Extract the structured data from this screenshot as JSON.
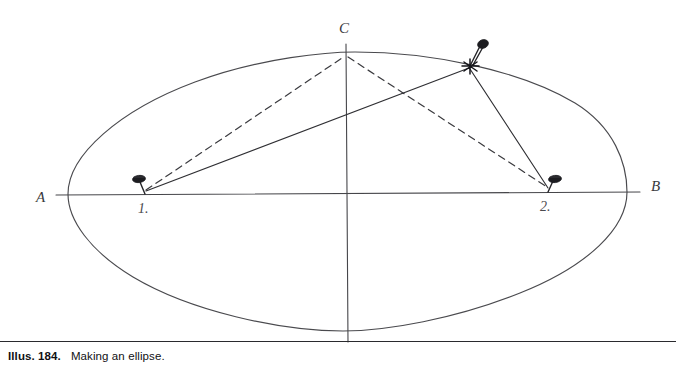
{
  "caption": {
    "number": "Illus. 184.",
    "text": "Making an ellipse."
  },
  "figure": {
    "title": "Making an ellipse",
    "method": "pin-and-string ellipse construction",
    "background_color": "#ffffff",
    "ink_color": "#3b3b3f",
    "labels": {
      "left_vertex": "A",
      "right_vertex": "B",
      "top_vertex": "C",
      "bottom_vertex": "D",
      "focus_left": "1.",
      "focus_right": "2."
    },
    "geometry": {
      "center_x": 347,
      "center_y": 193,
      "semi_major": 280,
      "semi_minor": 139,
      "vertex_a": [
        68,
        194
      ],
      "vertex_b": [
        627,
        192
      ],
      "vertex_c": [
        346,
        54
      ],
      "vertex_d": [
        347,
        331
      ],
      "focus_1": [
        145,
        194
      ],
      "focus_2": [
        548,
        192
      ],
      "pencil_point": [
        470,
        66
      ]
    },
    "strings": {
      "dashed_note": "string in starting position: focus 1 to C to focus 2",
      "solid_note": "string in current position: focus 1 to pencil point to focus 2"
    }
  }
}
